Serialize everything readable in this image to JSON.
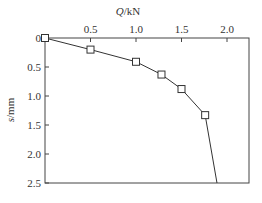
{
  "chart_data": {
    "type": "line",
    "title": "",
    "xlabel": "Q/kN",
    "ylabel": "s/mm",
    "x_axis_position": "top",
    "y_inverted": true,
    "xlim": [
      0,
      2.2
    ],
    "ylim": [
      0,
      2.5
    ],
    "xticks": [
      "0.5",
      "1.0",
      "1.5",
      "2.0"
    ],
    "yticks": [
      "0",
      "0.5",
      "1.0",
      "1.5",
      "2.0",
      "2.5"
    ],
    "grid": false,
    "series": [
      {
        "name": "Q-s curve",
        "marker": "square",
        "x": [
          0,
          0.5,
          1.0,
          1.28,
          1.5,
          1.76,
          1.89
        ],
        "y": [
          0,
          0.2,
          0.41,
          0.63,
          0.88,
          1.33,
          2.5
        ],
        "markers_on": [
          true,
          true,
          true,
          true,
          true,
          true,
          false
        ]
      }
    ]
  }
}
